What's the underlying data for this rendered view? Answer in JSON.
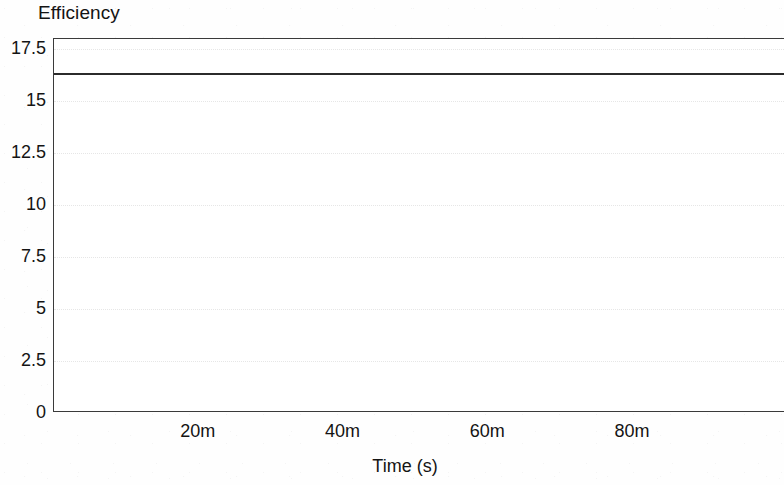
{
  "chart_data": {
    "type": "line",
    "title": "Efficiency",
    "xlabel": "Time (s)",
    "ylabel": "",
    "xlim": [
      0,
      101
    ],
    "ylim": [
      0,
      18.0
    ],
    "grid": true,
    "legend": null,
    "x_tick_labels": [
      "20m",
      "40m",
      "60m",
      "80m"
    ],
    "x_tick_values": [
      20,
      40,
      60,
      80
    ],
    "x_tick_unit": "m",
    "y_tick_labels": [
      "17.5",
      "15",
      "12.5",
      "10",
      "7.5",
      "5",
      "2.5",
      "0"
    ],
    "y_tick_values": [
      17.5,
      15,
      12.5,
      10,
      7.5,
      5,
      2.5,
      0
    ],
    "series": [
      {
        "name": "Efficiency",
        "color": "#2b2b2b",
        "constant_value": 16.35,
        "x": [
          0,
          10,
          20,
          30,
          40,
          50,
          60,
          70,
          80,
          90,
          101
        ],
        "values": [
          16.35,
          16.35,
          16.35,
          16.35,
          16.35,
          16.35,
          16.35,
          16.35,
          16.35,
          16.35,
          16.35
        ]
      }
    ]
  },
  "axes": {
    "frame_color": "#3a3a3a",
    "gridline_color": "#dedede",
    "background": "#ffffff"
  }
}
